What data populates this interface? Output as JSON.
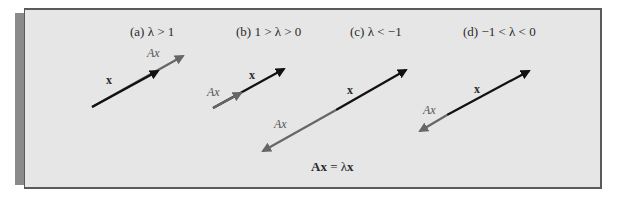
{
  "figure": {
    "panels": [
      {
        "id": "a",
        "title": "(a)  λ > 1",
        "x_label": "x",
        "ax_label": "Ax"
      },
      {
        "id": "b",
        "title": "(b)  1 > λ > 0",
        "x_label": "x",
        "ax_label": "Ax"
      },
      {
        "id": "c",
        "title": "(c)  λ < −1",
        "x_label": "x",
        "ax_label": "Ax"
      },
      {
        "id": "d",
        "title": "(d)  −1 < λ < 0",
        "x_label": "x",
        "ax_label": "Ax"
      }
    ],
    "equation": {
      "lhs_A": "A",
      "lhs_x": "x",
      "eq": " = λ",
      "rhs_x": "x"
    },
    "colors": {
      "background": "#e6e6e6",
      "border": "#5a5a5a",
      "shadow": "#8a8a8a",
      "x_vector": "#111111",
      "ax_vector": "#666666"
    }
  }
}
